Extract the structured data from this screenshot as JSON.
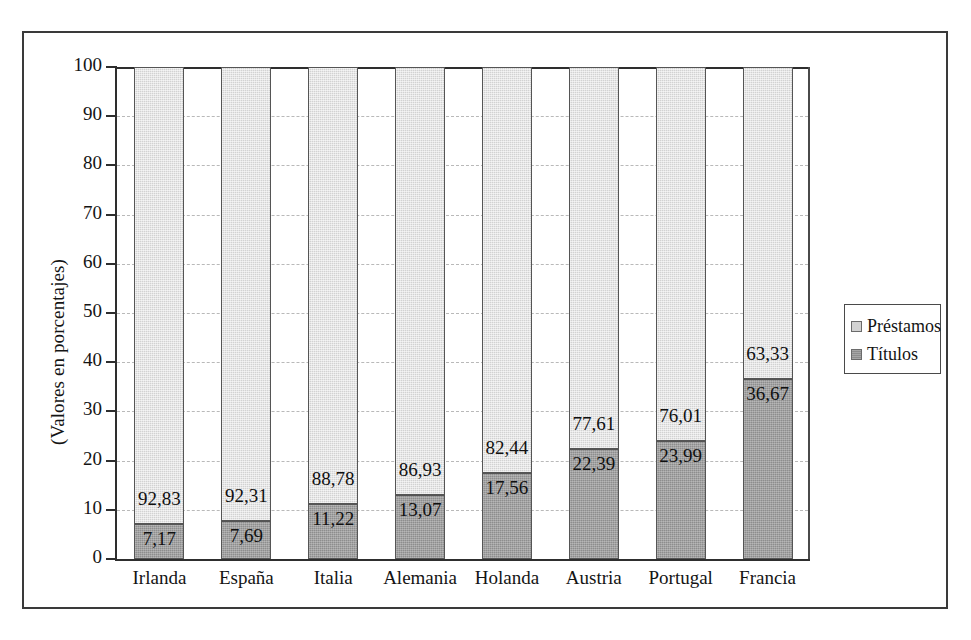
{
  "chart_data": {
    "type": "bar",
    "subtype": "stacked-bar-100",
    "title": "",
    "xlabel": "",
    "ylabel": "(Valores en porcentajes)",
    "ylim": [
      0,
      100
    ],
    "yticks": [
      0,
      10,
      20,
      30,
      40,
      50,
      60,
      70,
      80,
      90,
      100
    ],
    "ytick_labels": [
      "0",
      "10",
      "20",
      "30",
      "40",
      "50",
      "60",
      "70",
      "80",
      "90",
      "100"
    ],
    "grid": "horizontal-dashed",
    "legend_position": "right",
    "categories": [
      "Irlanda",
      "España",
      "Italia",
      "Alemania",
      "Holanda",
      "Austria",
      "Portugal",
      "Francia"
    ],
    "series": [
      {
        "name": "Títulos",
        "color": "#8d8d8d",
        "values": [
          7.17,
          7.69,
          11.22,
          13.07,
          17.56,
          22.39,
          23.99,
          36.67
        ],
        "labels": [
          "7,17",
          "7,69",
          "11,22",
          "13,07",
          "17,56",
          "22,39",
          "23,99",
          "36,67"
        ]
      },
      {
        "name": "Préstamos",
        "color": "#d2d2d2",
        "values": [
          92.83,
          92.31,
          88.78,
          86.93,
          82.44,
          77.61,
          76.01,
          63.33
        ],
        "labels": [
          "92,83",
          "92,31",
          "88,78",
          "86,93",
          "82,44",
          "77,61",
          "76,01",
          "63,33"
        ]
      }
    ]
  },
  "legend": {
    "items": [
      {
        "label": "Préstamos",
        "color": "#d2d2d2"
      },
      {
        "label": "Títulos",
        "color": "#8d8d8d"
      }
    ]
  },
  "axis": {
    "y_title": "(Valores en porcentajes)"
  }
}
